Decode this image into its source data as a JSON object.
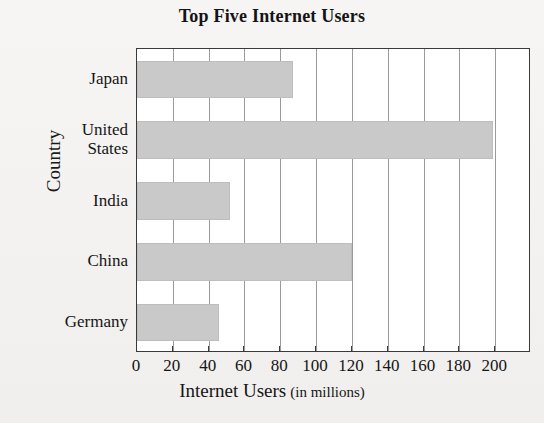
{
  "chart_data": {
    "type": "bar",
    "orientation": "horizontal",
    "title": "Top Five Internet Users",
    "xlabel": "Internet Users (in millions)",
    "xlabel_main": "Internet Users",
    "xlabel_sub": "(in millions)",
    "ylabel": "Country",
    "categories": [
      "Japan",
      "United States",
      "India",
      "China",
      "Germany"
    ],
    "category_display": [
      "Japan",
      "United\nStates",
      "India",
      "China",
      "Germany"
    ],
    "values": [
      87,
      199,
      52,
      120,
      46
    ],
    "xlim": [
      0,
      220
    ],
    "xticks": [
      0,
      20,
      40,
      60,
      80,
      100,
      120,
      140,
      160,
      180,
      200
    ],
    "xtick_labels": [
      "0",
      "20",
      "40",
      "60",
      "80",
      "100",
      "120",
      "140",
      "160",
      "180",
      "200"
    ],
    "grid": true,
    "grid_axis": "x",
    "legend": "none",
    "bar_color": "#c9c9c9",
    "frame_color": "#3a3a3a",
    "gridline_color": "#9a9a9a",
    "background": "#ffffff",
    "page_background": "#f1f0ee"
  }
}
